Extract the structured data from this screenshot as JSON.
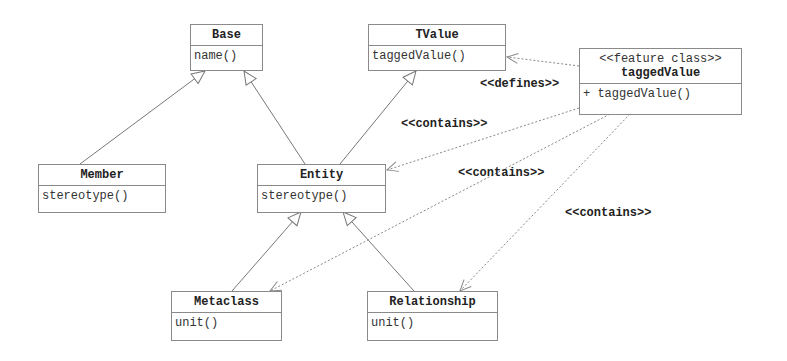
{
  "diagram": {
    "type": "uml-class-diagram",
    "classes": [
      {
        "id": "base",
        "name": "Base",
        "stereotype": null,
        "operations": [
          "name()"
        ]
      },
      {
        "id": "tvalue",
        "name": "TValue",
        "stereotype": null,
        "operations": [
          "taggedValue()"
        ]
      },
      {
        "id": "taggedvalue",
        "name": "taggedValue",
        "stereotype": "<<feature class>>",
        "operations": [
          "+ taggedValue()"
        ]
      },
      {
        "id": "member",
        "name": "Member",
        "stereotype": null,
        "operations": [
          "stereotype()"
        ]
      },
      {
        "id": "entity",
        "name": "Entity",
        "stereotype": null,
        "operations": [
          "stereotype()"
        ]
      },
      {
        "id": "metaclass",
        "name": "Metaclass",
        "stereotype": null,
        "operations": [
          "unit()"
        ]
      },
      {
        "id": "relationship",
        "name": "Relationship",
        "stereotype": null,
        "operations": [
          "unit()"
        ]
      }
    ],
    "relations": [
      {
        "from": "member",
        "to": "base",
        "kind": "generalization",
        "label": ""
      },
      {
        "from": "entity",
        "to": "base",
        "kind": "generalization",
        "label": ""
      },
      {
        "from": "entity",
        "to": "tvalue",
        "kind": "generalization",
        "label": ""
      },
      {
        "from": "metaclass",
        "to": "entity",
        "kind": "generalization",
        "label": ""
      },
      {
        "from": "relationship",
        "to": "entity",
        "kind": "generalization",
        "label": ""
      },
      {
        "from": "taggedvalue",
        "to": "tvalue",
        "kind": "dependency",
        "label": "<<defines>>"
      },
      {
        "from": "taggedvalue",
        "to": "entity",
        "kind": "dependency",
        "label": "<<contains>>"
      },
      {
        "from": "taggedvalue",
        "to": "metaclass",
        "kind": "dependency",
        "label": "<<contains>>"
      },
      {
        "from": "taggedvalue",
        "to": "relationship",
        "kind": "dependency",
        "label": "<<contains>>"
      }
    ],
    "labels": {
      "defines": "<<defines>>",
      "contains_entity": "<<contains>>",
      "contains_metaclass": "<<contains>>",
      "contains_relationship": "<<contains>>"
    },
    "colors": {
      "line": "#777777",
      "border": "#8a8a8a",
      "text": "#222222",
      "background": "#ffffff"
    }
  }
}
